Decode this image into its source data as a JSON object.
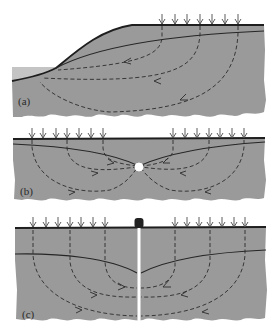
{
  "figure": {
    "colors": {
      "ground": "#9a9a9a",
      "lake": "#c4c4c4",
      "surface_line": "#1e1e1e",
      "water_table": "#262626",
      "flow_line": "#2b2b2b",
      "recharge_arrow": "#4a4a4a",
      "spring": "#ffffff",
      "well_casing": "#ffffff",
      "well_cap": "#222222",
      "background": "#ffffff"
    },
    "panels": [
      {
        "label": "(a)",
        "setting": "hillslope discharging to lake",
        "recharge_arrow_count": 7
      },
      {
        "label": "(b)",
        "setting": "point discharge (spring/drain) below valley",
        "recharge_arrow_count_left": 7,
        "recharge_arrow_count_right": 7
      },
      {
        "label": "(c)",
        "setting": "pumping well creating cone of depression",
        "recharge_arrow_count_left": 7,
        "recharge_arrow_count_right": 7
      }
    ]
  }
}
